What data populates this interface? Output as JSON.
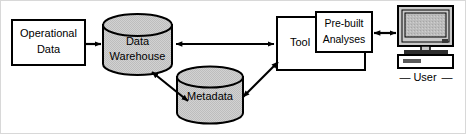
{
  "diagram": {
    "colors": {
      "stroke": "#000000",
      "cylinder_fill": "#cccccc",
      "cylinder_top_fill": "#c4c4c4",
      "box_fill": "#ffffff",
      "monitor_bezel": "#c9c9c9",
      "monitor_screen": "#b8b8b8",
      "frame": "#d8d8d8"
    },
    "nodes": {
      "operational_data": {
        "label_line1": "Operational",
        "label_line2": "Data",
        "shape": "rectangle"
      },
      "data_warehouse": {
        "label_line1": "Data",
        "label_line2": "Warehouse",
        "shape": "cylinder"
      },
      "metadata": {
        "label_line1": "Metadata",
        "shape": "cylinder"
      },
      "tool": {
        "label_line1": "Tool",
        "shape": "rectangle"
      },
      "prebuilt_analyses": {
        "label_line1": "Pre-built",
        "label_line2": "Analyses",
        "shape": "rectangle"
      },
      "user": {
        "label_line1": "User",
        "shape": "computer-workstation",
        "dash_left": "—",
        "dash_right": "—"
      }
    },
    "arrows": [
      {
        "name": "operational-data-to-warehouse",
        "from": "operational_data",
        "to": "data_warehouse",
        "heads": "single"
      },
      {
        "name": "warehouse-to-tool",
        "from": "data_warehouse",
        "to": "tool",
        "heads": "double"
      },
      {
        "name": "warehouse-to-metadata",
        "from": "data_warehouse",
        "to": "metadata",
        "heads": "double"
      },
      {
        "name": "metadata-to-tool",
        "from": "metadata",
        "to": "tool",
        "heads": "double"
      },
      {
        "name": "analyses-to-user",
        "from": "prebuilt_analyses",
        "to": "user",
        "heads": "double"
      }
    ]
  }
}
